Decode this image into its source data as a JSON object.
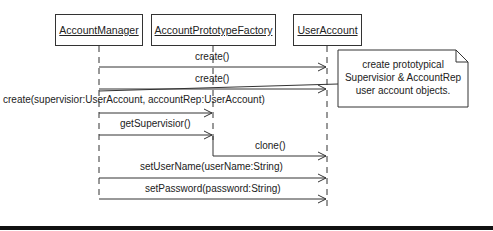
{
  "objects": [
    {
      "name": "AccountManager"
    },
    {
      "name": "AccountPrototypeFactory"
    },
    {
      "name": "UserAccount"
    }
  ],
  "messages": [
    {
      "label": "create()"
    },
    {
      "label": "create()"
    },
    {
      "label": "create(supervisior:UserAccount, accountRep:UserAccount)"
    },
    {
      "label": "getSupervisior()"
    },
    {
      "label": "clone()"
    },
    {
      "label": "setUserName(userName:String)"
    },
    {
      "label": "setPassword(password:String)"
    }
  ],
  "note": {
    "line1": "create prototypical",
    "line2": "Supervisior & AccountRep",
    "line3": "user account objects."
  }
}
